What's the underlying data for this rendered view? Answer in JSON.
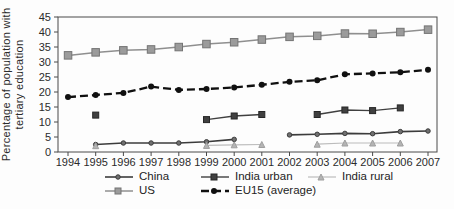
{
  "chart_data": {
    "type": "line",
    "title": "",
    "xlabel": "",
    "ylabel": "Percentage of population with tertiary education",
    "ylabel_lines": [
      "Percentage of  population with",
      "tertiary education"
    ],
    "ylim": [
      0,
      45
    ],
    "ytick_step": 5,
    "grid": false,
    "legend_position": "bottom",
    "categories": [
      "1994",
      "1995",
      "1996",
      "1997",
      "1998",
      "1999",
      "2000",
      "2001",
      "2002",
      "2003",
      "2004",
      "2005",
      "2006",
      "2007"
    ],
    "series": [
      {
        "name": "China",
        "values": [
          null,
          2.5,
          3.0,
          3.0,
          3.0,
          3.4,
          4.2,
          null,
          5.7,
          5.9,
          6.2,
          6.1,
          6.8,
          7.0
        ],
        "style": {
          "color": "#3c3c3c",
          "width": 1.6,
          "dash": "",
          "marker": "dot",
          "marker_size": 4.5,
          "marker_fill": "#707070",
          "marker_stroke": "#3c3c3c"
        }
      },
      {
        "name": "India urban",
        "values": [
          null,
          12.3,
          null,
          null,
          null,
          10.8,
          12.0,
          12.5,
          null,
          12.5,
          14.0,
          13.8,
          14.7,
          null
        ],
        "style": {
          "color": "#404040",
          "width": 1.4,
          "dash": "",
          "marker": "square",
          "marker_size": 6,
          "marker_fill": "#404040",
          "marker_stroke": "#262626"
        }
      },
      {
        "name": "India rural",
        "values": [
          null,
          2.1,
          null,
          null,
          null,
          2.2,
          2.4,
          2.5,
          null,
          2.6,
          3.0,
          3.0,
          3.0,
          null
        ],
        "style": {
          "color": "#bcbcbc",
          "width": 1.2,
          "dash": "",
          "marker": "triangle",
          "marker_size": 6,
          "marker_fill": "#b4b4b4",
          "marker_stroke": "#9e9e9e"
        }
      },
      {
        "name": "US",
        "values": [
          32.2,
          33.2,
          33.9,
          34.2,
          35.0,
          36.0,
          36.6,
          37.5,
          38.4,
          38.7,
          39.5,
          39.4,
          40.0,
          40.8
        ],
        "style": {
          "color": "#8f8f8f",
          "width": 1.5,
          "dash": "",
          "marker": "square",
          "marker_size": 7.5,
          "marker_fill": "#9b9b9b",
          "marker_stroke": "#747474"
        }
      },
      {
        "name": "EU15 (average)",
        "values": [
          18.3,
          19.0,
          19.7,
          21.8,
          20.7,
          21.0,
          21.5,
          22.4,
          23.4,
          23.9,
          25.9,
          26.2,
          26.6,
          27.4
        ],
        "style": {
          "color": "#101010",
          "width": 2.3,
          "dash": "8 4",
          "marker": "circle",
          "marker_size": 6,
          "marker_fill": "#101010",
          "marker_stroke": ""
        }
      }
    ]
  }
}
